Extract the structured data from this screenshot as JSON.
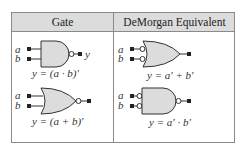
{
  "table": {
    "headers": [
      "Gate",
      "DeMorgan Equivalent"
    ],
    "rows": [
      {
        "gate": {
          "type": "NAND",
          "inputs": [
            "a",
            "b"
          ],
          "output": "y",
          "equation": "y = (a · b)'"
        },
        "equivalent": {
          "type": "OR with inverted inputs",
          "inputs": [
            "a",
            "b"
          ],
          "equation": "y = a' + b'"
        }
      },
      {
        "gate": {
          "type": "NOR",
          "inputs": [
            "a",
            "b"
          ],
          "equation": "y = (a + b)'"
        },
        "equivalent": {
          "type": "AND with inverted inputs",
          "inputs": [
            "a",
            "b"
          ],
          "equation": "y = a' · b'"
        }
      }
    ]
  },
  "colors": {
    "gate_fill": "#dcdcdc",
    "header_fill": "#dcdcdc",
    "border": "#8a8a8a",
    "stroke": "#333333"
  }
}
